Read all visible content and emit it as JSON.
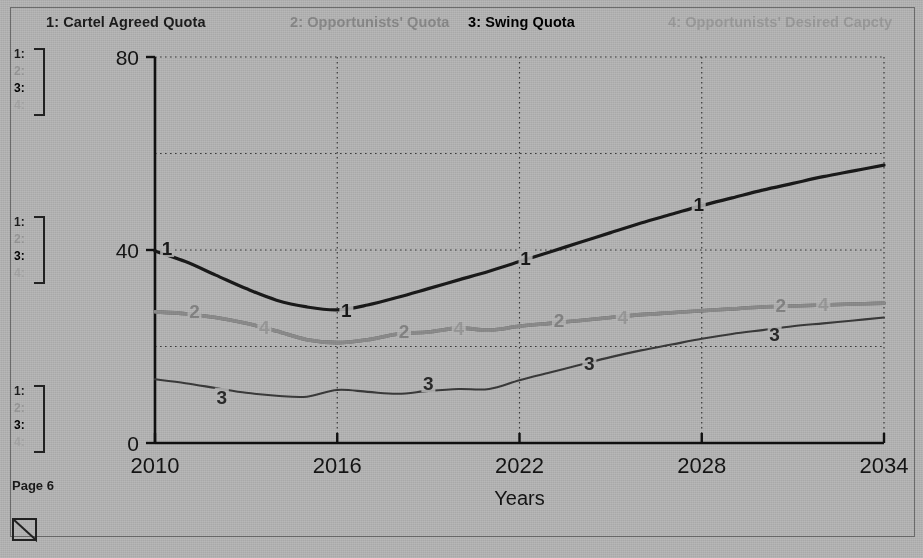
{
  "page": {
    "footer_label": "Page 6",
    "background_color": "#b8b8b8"
  },
  "legend": {
    "entries": [
      {
        "num": "1",
        "label": "1: Cartel Agreed Quota",
        "color": "#1d1d1d"
      },
      {
        "num": "2",
        "label": "2: Opportunists' Quota",
        "color": "#8b8b8b"
      },
      {
        "num": "3",
        "label": "3: Swing Quota",
        "color": "#000000"
      },
      {
        "num": "4",
        "label": "4: Opportunists' Desired Capcty",
        "color": "#9d9d9d"
      }
    ]
  },
  "key_blocks": {
    "items": [
      "1:",
      "2:",
      "3:",
      "4:"
    ]
  },
  "chart_data": {
    "type": "line",
    "title": "",
    "xlabel": "Years",
    "ylabel": "",
    "xlim": [
      2010,
      2034
    ],
    "ylim": [
      0,
      80
    ],
    "xticks": [
      "2010",
      "2016",
      "2022",
      "2028",
      "2034"
    ],
    "yticks": [
      "0",
      "40",
      "80"
    ],
    "gridlines": {
      "horizontal_values": [
        20,
        40,
        60,
        80
      ],
      "vertical_values": [
        2016,
        2022,
        2028,
        2034
      ],
      "style": "dotted"
    },
    "legend_position": "top",
    "x": [
      2010,
      2011,
      2012,
      2013,
      2014,
      2015,
      2016,
      2017,
      2018,
      2019,
      2020,
      2021,
      2022,
      2023,
      2024,
      2025,
      2026,
      2027,
      2028,
      2029,
      2030,
      2031,
      2032,
      2033,
      2034
    ],
    "series": [
      {
        "name": "1: Cartel Agreed Quota",
        "tag": "1",
        "color": "#1a1a1a",
        "width": 3.2,
        "values": [
          39.8,
          37.6,
          34.8,
          32.0,
          29.6,
          28.2,
          27.6,
          28.6,
          30.2,
          32.0,
          33.8,
          35.6,
          37.6,
          39.6,
          41.6,
          43.6,
          45.6,
          47.4,
          49.2,
          50.8,
          52.4,
          53.8,
          55.2,
          56.4,
          57.6
        ],
        "tag_points": [
          {
            "x": 2010.4,
            "y": 40.4
          },
          {
            "x": 2016.3,
            "y": 27.6
          },
          {
            "x": 2022.2,
            "y": 38.4
          },
          {
            "x": 2027.9,
            "y": 49.6
          }
        ]
      },
      {
        "name": "2: Opportunists' Quota",
        "tag": "2",
        "color": "#6e6e6e",
        "width": 3.6,
        "values": [
          27.2,
          26.8,
          26.0,
          24.8,
          23.2,
          21.4,
          20.8,
          21.4,
          22.6,
          23.0,
          23.8,
          23.4,
          24.2,
          24.8,
          25.4,
          26.0,
          26.6,
          27.0,
          27.4,
          27.8,
          28.2,
          28.4,
          28.6,
          28.8,
          29.0
        ],
        "tag_points": [
          {
            "x": 2011.3,
            "y": 27.4
          },
          {
            "x": 2018.2,
            "y": 23.2
          },
          {
            "x": 2023.3,
            "y": 25.4
          },
          {
            "x": 2030.6,
            "y": 28.6
          }
        ]
      },
      {
        "name": "3: Swing Quota",
        "tag": "3",
        "color": "#3b3b3b",
        "width": 2.1,
        "values": [
          13.2,
          12.4,
          11.4,
          10.4,
          9.8,
          9.6,
          11.0,
          10.6,
          10.2,
          10.8,
          11.2,
          11.2,
          13.0,
          14.6,
          16.2,
          17.8,
          19.2,
          20.4,
          21.6,
          22.6,
          23.4,
          24.2,
          24.8,
          25.4,
          26.0
        ],
        "tag_points": [
          {
            "x": 2012.2,
            "y": 9.6
          },
          {
            "x": 2019.0,
            "y": 12.4
          },
          {
            "x": 2024.3,
            "y": 16.6
          },
          {
            "x": 2030.4,
            "y": 22.6
          }
        ]
      },
      {
        "name": "4: Opportunists' Desired Capcty",
        "tag": "4",
        "color": "#8e8e8e",
        "width": 3.6,
        "values": [
          27.2,
          26.8,
          26.0,
          24.8,
          23.2,
          21.4,
          20.8,
          21.4,
          22.6,
          23.0,
          23.8,
          23.4,
          24.2,
          24.8,
          25.4,
          26.0,
          26.6,
          27.0,
          27.4,
          27.8,
          28.2,
          28.4,
          28.6,
          28.8,
          29.0
        ],
        "tag_points": [
          {
            "x": 2013.6,
            "y": 24.0
          },
          {
            "x": 2020.0,
            "y": 23.8
          },
          {
            "x": 2025.4,
            "y": 26.2
          },
          {
            "x": 2032.0,
            "y": 28.8
          }
        ]
      }
    ],
    "note": "Series 2 and 4 are coincident (identical values); they render as one overlapping trace."
  }
}
